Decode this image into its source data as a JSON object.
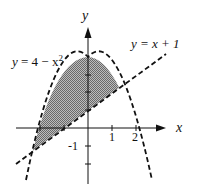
{
  "diagram": {
    "curve1_label": {
      "lhs": "y",
      "eq": " = 4 − x",
      "sup": "2"
    },
    "curve2_label": "y = x + 1",
    "x_axis_label": "x",
    "y_axis_label": "y",
    "ticks": {
      "x1": "1",
      "x2": "2",
      "ym1": "-1"
    },
    "shading_color": "#8a8a8a",
    "line_color": "#111111"
  }
}
